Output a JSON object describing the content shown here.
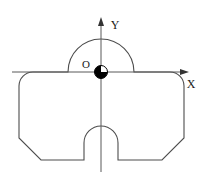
{
  "figure": {
    "type": "engineering-cross-section",
    "background_color": "#ffffff",
    "outline_color": "#4d4d4d",
    "axis_color": "#595959",
    "marker_fill_color": "#000000",
    "marker_empty_color": "#ffffff",
    "canvas": {
      "width": 211,
      "height": 183
    }
  },
  "axes": {
    "x_axis": {
      "label": "X",
      "label_x": 191,
      "label_y": 84,
      "start_x": 12,
      "end_x": 188,
      "y": 72,
      "arrow": true
    },
    "y_axis": {
      "label": "Y",
      "label_x": 114,
      "label_y": 28,
      "x": 101,
      "start_y": 172,
      "end_y": 18,
      "arrow": true
    },
    "origin": {
      "label": "O",
      "label_x": 85,
      "label_y": 68,
      "x": 101,
      "y": 72,
      "marker_radius": 6.5,
      "marker_style": "quadrant-filled-circle"
    }
  },
  "part_outline": {
    "description": "Symmetric plate: semicircular boss on top, rounded upper corners, chamfered lower corners, U-slot at bottom center",
    "top_arc": {
      "center_x": 101,
      "center_y": 72,
      "radius": 33,
      "left_x": 68,
      "right_x": 134
    },
    "body": {
      "left_x": 19,
      "right_x": 184,
      "top_y": 72,
      "bottom_y": 160,
      "corner_radius": 14,
      "chamfer": 22
    },
    "bottom_slot": {
      "center_x": 101,
      "left_x": 84,
      "right_x": 118,
      "top_y": 126,
      "bottom_y": 160,
      "arc_radius": 17
    }
  }
}
